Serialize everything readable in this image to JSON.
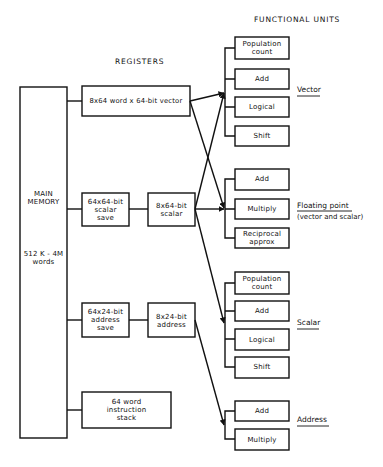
{
  "headers": {
    "registers": "REGISTERS",
    "functional_units": "FUNCTIONAL UNITS"
  },
  "main_memory": {
    "title": "MAIN\nMEMORY",
    "size": "512 K - 4M\nwords"
  },
  "registers": {
    "vector": "8x64 word x 64-bit vector",
    "scalar_save": "64x64-bit\nscalar\nsave",
    "scalar": "8x64-bit\nscalar",
    "address_save": "64x24-bit\naddress\nsave",
    "address": "8x24-bit\naddress",
    "instruction_stack": "64 word\ninstruction\nstack"
  },
  "functional_units": {
    "vector": {
      "label": "Vector",
      "units": [
        "Population\ncount",
        "Add",
        "Logical",
        "Shift"
      ]
    },
    "floating_point": {
      "label": "Floating point",
      "sublabel": "(vector and scalar)",
      "units": [
        "Add",
        "Multiply",
        "Reciprocal\napprox"
      ]
    },
    "scalar": {
      "label": "Scalar",
      "units": [
        "Population\ncount",
        "Add",
        "Logical",
        "Shift"
      ]
    },
    "address": {
      "label": "Address",
      "units": [
        "Add",
        "Multiply"
      ]
    }
  },
  "connections": [
    {
      "from": "main_memory",
      "to": "vector"
    },
    {
      "from": "main_memory",
      "to": "scalar_save"
    },
    {
      "from": "main_memory",
      "to": "address_save"
    },
    {
      "from": "main_memory",
      "to": "instruction_stack"
    },
    {
      "from": "scalar_save",
      "to": "scalar"
    },
    {
      "from": "address_save",
      "to": "address"
    },
    {
      "from": "vector",
      "to": "vector_units"
    },
    {
      "from": "vector",
      "to": "floating_point_units"
    },
    {
      "from": "scalar",
      "to": "vector_units"
    },
    {
      "from": "scalar",
      "to": "floating_point_units"
    },
    {
      "from": "scalar",
      "to": "scalar_units"
    },
    {
      "from": "address",
      "to": "address_units"
    }
  ]
}
